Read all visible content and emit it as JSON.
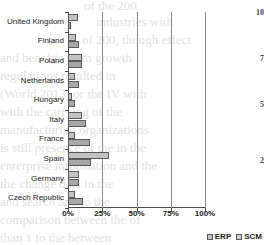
{
  "chart_data": {
    "type": "bar",
    "orientation": "horizontal",
    "title": "",
    "xlabel": "",
    "ylabel": "",
    "xlim": [
      0,
      100
    ],
    "xticks": [
      "0%",
      "25%",
      "50%",
      "75%",
      "100%"
    ],
    "xtick_values": [
      0,
      25,
      50,
      75,
      100
    ],
    "grid": true,
    "legend_position": "bottom-right",
    "categories": [
      "United Kingdom",
      "Finland",
      "Poland",
      "Netherlands",
      "Hungary",
      "Italy",
      "France",
      "Spain",
      "Germany",
      "Czech Republic"
    ],
    "series": [
      {
        "name": "ERP",
        "color": "#c2c2c2",
        "values": [
          7,
          6,
          10,
          5,
          3,
          10,
          5,
          30,
          8,
          5
        ]
      },
      {
        "name": "SCM",
        "color": "#a8a8a8",
        "values": [
          2,
          8,
          10,
          8,
          5,
          13,
          16,
          17,
          8,
          11
        ]
      }
    ]
  },
  "legend": {
    "items": [
      {
        "label": "ERP"
      },
      {
        "label": "SCM"
      }
    ]
  },
  "page_margin_numbers": [
    "10",
    "7",
    "5",
    "2"
  ],
  "background_bleed": [
    "of  the  200",
    "industries  with",
    "of  200,  though  effect",
    "and  benefits  from  growth",
    "regulations  resulted  in",
    "(World 2013)  or  the  IV  with",
    "with  the  carrying  of  the",
    "manufacturing  organizations",
    "is  still  presence  of  the  in  the",
    "enterprise  information  and  the",
    "the  change  data  in  the",
    "and  search  and  to  the",
    "comparison  between  the  of",
    "than  1  to  the  between"
  ]
}
